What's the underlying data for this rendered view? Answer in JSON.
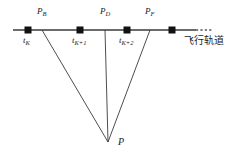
{
  "figure": {
    "axis_label": "飞行轨道",
    "vertex_label": "P",
    "track_points": [
      {
        "id": "pb",
        "label": "P",
        "sub": "B",
        "x": 42
      },
      {
        "id": "pd",
        "label": "P",
        "sub": "D",
        "x": 105
      },
      {
        "id": "pf",
        "label": "P",
        "sub": "F",
        "x": 150
      }
    ],
    "time_marks": [
      {
        "id": "tk",
        "label": "t",
        "sub": "K",
        "x": 28
      },
      {
        "id": "tk1",
        "label": "t",
        "sub": "K+1",
        "x": 80
      },
      {
        "id": "tk2",
        "label": "t",
        "sub": "K+2",
        "x": 127
      }
    ],
    "markers": [
      {
        "id": "m1",
        "x": 28,
        "y": 30
      },
      {
        "id": "m2",
        "x": 80,
        "y": 30
      },
      {
        "id": "m3",
        "x": 127,
        "y": 30
      },
      {
        "id": "m4",
        "x": 172,
        "y": 30
      }
    ],
    "vertex": {
      "x": 108,
      "y": 142
    },
    "trajectory_line": {
      "x1": 13,
      "y1": 30,
      "x2": 196,
      "y2": 30
    },
    "trajectory_dashed": {
      "x1": 196,
      "y1": 30,
      "x2": 212,
      "y2": 30
    },
    "rays": [
      {
        "id": "ray-b",
        "x1": 42,
        "y1": 30
      },
      {
        "id": "ray-d",
        "x1": 105,
        "y1": 30
      },
      {
        "id": "ray-f",
        "x1": 150,
        "y1": 30
      }
    ],
    "colors": {
      "line": "#3a3a3a",
      "marker": "#111111",
      "text": "#1a1a1a"
    }
  }
}
